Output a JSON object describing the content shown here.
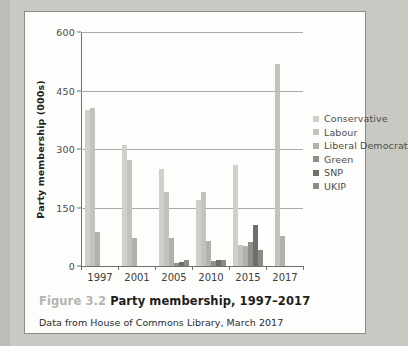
{
  "figure": {
    "caption_number": "Figure 3.2",
    "caption_title": "Party membership, 1997–2017",
    "source_note": "Data from House of Commons Library, March 2017"
  },
  "chart_data": {
    "type": "bar",
    "title": "Party membership, 1997–2017",
    "xlabel": "",
    "ylabel": "Party membership (000s)",
    "ylim": [
      0,
      600
    ],
    "yticks": [
      0,
      150,
      300,
      450,
      600
    ],
    "grid": true,
    "legend_position": "right",
    "categories": [
      "1997",
      "2001",
      "2005",
      "2010",
      "2015",
      "2017"
    ],
    "series": [
      {
        "name": "Conservative",
        "color": "#cfcfcb",
        "values": [
          400,
          311,
          250,
          170,
          260,
          0
        ]
      },
      {
        "name": "Labour",
        "color": "#c2c2be",
        "values": [
          405,
          272,
          190,
          190,
          53,
          517
        ]
      },
      {
        "name": "Liberal Democrat",
        "color": "#b0b0ac",
        "values": [
          87,
          73,
          73,
          65,
          52,
          78
        ]
      },
      {
        "name": "Green",
        "color": "#8f8f8b",
        "values": [
          0,
          0,
          8,
          13,
          61,
          0
        ]
      },
      {
        "name": "SNP",
        "color": "#6e6e6b",
        "values": [
          0,
          0,
          11,
          16,
          105,
          0
        ]
      },
      {
        "name": "UKIP",
        "color": "#8a8a86",
        "values": [
          0,
          0,
          16,
          15,
          42,
          0
        ]
      }
    ]
  },
  "axis": {
    "y_tick_labels": [
      "0",
      "150",
      "300",
      "450",
      "600"
    ],
    "x_tick_labels": [
      "1997",
      "2001",
      "2005",
      "2010",
      "2015",
      "2017"
    ],
    "y_axis_title": "Party membership (000s)"
  },
  "legend": {
    "items": [
      {
        "label": "Conservative",
        "color": "#cfcfcb"
      },
      {
        "label": "Labour",
        "color": "#c2c2be"
      },
      {
        "label": "Liberal Democrat",
        "color": "#b0b0ac"
      },
      {
        "label": "Green",
        "color": "#8f8f8b"
      },
      {
        "label": "SNP",
        "color": "#6e6e6b"
      },
      {
        "label": "UKIP",
        "color": "#8a8a86"
      }
    ]
  }
}
